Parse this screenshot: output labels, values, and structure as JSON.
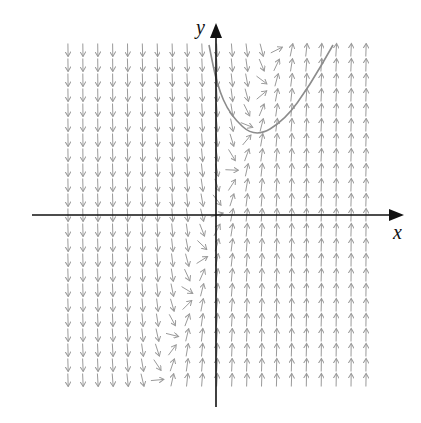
{
  "diagram": {
    "type": "direction-field",
    "axis_labels": {
      "x": "x",
      "y": "y"
    },
    "colors": {
      "axes": "#111111",
      "field_segments": "#9a9a9a",
      "solution_curve": "#8c8c8c",
      "background": "#ffffff"
    },
    "origin_px": [
      216,
      215
    ],
    "grid": {
      "columns": 21,
      "rows": 23,
      "x_start_px": 68,
      "x_step_px": 14.9,
      "y_start_px": 50,
      "y_step_px": 15
    },
    "solution_curve_px": [
      [
        209,
        45
      ],
      [
        217,
        85
      ],
      [
        230,
        115
      ],
      [
        255,
        138
      ],
      [
        285,
        120
      ],
      [
        310,
        85
      ],
      [
        333,
        45
      ]
    ]
  }
}
